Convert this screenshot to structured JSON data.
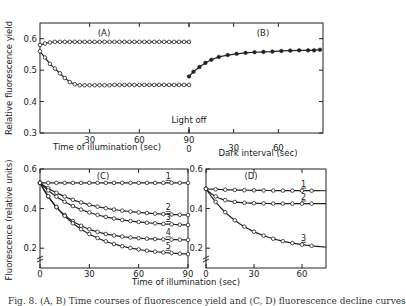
{
  "chart_data": [
    {
      "panel": "A",
      "type": "line",
      "title": "(A)",
      "xlabel": "Time of illumination (sec)",
      "ylabel": "Relative fluorescence yield",
      "xlim": [
        0,
        90
      ],
      "ylim": [
        0.3,
        0.65
      ],
      "xticks": [
        "30",
        "60",
        "90"
      ],
      "yticks": [
        "0.6",
        "0.5",
        "0.4",
        "0.3"
      ],
      "annotation": "Light off",
      "series": [
        {
          "name": "upper",
          "marker": "open-circle",
          "x": [
            0,
            3,
            6,
            9,
            12,
            15,
            18,
            21,
            24,
            27,
            30,
            33,
            36,
            39,
            42,
            45,
            48,
            51,
            54,
            57,
            60,
            63,
            66,
            69,
            72,
            75,
            78,
            81,
            84,
            87,
            90
          ],
          "y": [
            0.58,
            0.585,
            0.588,
            0.59,
            0.59,
            0.59,
            0.59,
            0.59,
            0.59,
            0.59,
            0.59,
            0.59,
            0.59,
            0.59,
            0.59,
            0.59,
            0.59,
            0.59,
            0.59,
            0.59,
            0.59,
            0.59,
            0.59,
            0.59,
            0.59,
            0.59,
            0.59,
            0.59,
            0.59,
            0.59,
            0.59
          ]
        },
        {
          "name": "lower",
          "marker": "open-circle",
          "x": [
            0,
            3,
            6,
            9,
            12,
            15,
            18,
            21,
            24,
            27,
            30,
            33,
            36,
            39,
            42,
            45,
            48,
            51,
            54,
            57,
            60,
            63,
            66,
            69,
            72,
            75,
            78,
            81,
            84,
            87,
            90
          ],
          "y": [
            0.56,
            0.54,
            0.52,
            0.505,
            0.49,
            0.475,
            0.462,
            0.455,
            0.452,
            0.452,
            0.452,
            0.452,
            0.452,
            0.452,
            0.452,
            0.453,
            0.453,
            0.453,
            0.453,
            0.453,
            0.453,
            0.453,
            0.453,
            0.453,
            0.453,
            0.453,
            0.453,
            0.453,
            0.453,
            0.453,
            0.453
          ]
        }
      ]
    },
    {
      "panel": "B",
      "type": "line",
      "title": "(B)",
      "xlabel": "Dark interval (sec)",
      "xlim": [
        0,
        90
      ],
      "ylim": [
        0.3,
        0.65
      ],
      "xticks": [
        "0",
        "30",
        "60"
      ],
      "series": [
        {
          "name": "dark recovery",
          "marker": "filled-circle",
          "x": [
            0,
            3,
            7,
            11,
            15,
            20,
            26,
            32,
            38,
            44,
            50,
            56,
            62,
            68,
            74,
            80,
            84,
            88
          ],
          "y": [
            0.48,
            0.495,
            0.51,
            0.523,
            0.533,
            0.542,
            0.548,
            0.552,
            0.555,
            0.557,
            0.558,
            0.559,
            0.561,
            0.562,
            0.563,
            0.563,
            0.563,
            0.565
          ]
        }
      ]
    },
    {
      "panel": "C",
      "type": "line",
      "title": "(C)",
      "xlabel": "Time of illumination (sec)",
      "ylabel": "Fluorescence (relative units)",
      "xlim": [
        0,
        90
      ],
      "ylim": [
        0.1,
        0.6
      ],
      "xticks": [
        "0",
        "30",
        "60",
        "90"
      ],
      "yticks": [
        "0.6",
        "0.4",
        "0.2"
      ],
      "series": [
        {
          "name": "1",
          "y0": 0.53,
          "yinf": 0.53,
          "k": 0.05
        },
        {
          "name": "2",
          "y0": 0.53,
          "yinf": 0.36,
          "k": 0.035
        },
        {
          "name": "3",
          "y0": 0.53,
          "yinf": 0.31,
          "k": 0.038
        },
        {
          "name": "4",
          "y0": 0.53,
          "yinf": 0.24,
          "k": 0.055
        },
        {
          "name": "5",
          "y0": 0.53,
          "yinf": 0.16,
          "k": 0.04
        }
      ]
    },
    {
      "panel": "D",
      "type": "line",
      "title": "(D)",
      "xlim": [
        0,
        75
      ],
      "ylim": [
        0.1,
        0.6
      ],
      "xticks": [
        "0",
        "30",
        "60"
      ],
      "yticks": [
        "0.6",
        "0.4",
        "0.2"
      ],
      "series": [
        {
          "name": "1",
          "y0": 0.5,
          "yinf": 0.49,
          "k": 0.05
        },
        {
          "name": "2",
          "y0": 0.5,
          "yinf": 0.425,
          "k": 0.12
        },
        {
          "name": "3",
          "y0": 0.5,
          "yinf": 0.19,
          "k": 0.04
        }
      ]
    }
  ],
  "caption": "Fig. 8. (A, B) Time courses of fluorescence yield and (C, D) fluorescence decline curves"
}
